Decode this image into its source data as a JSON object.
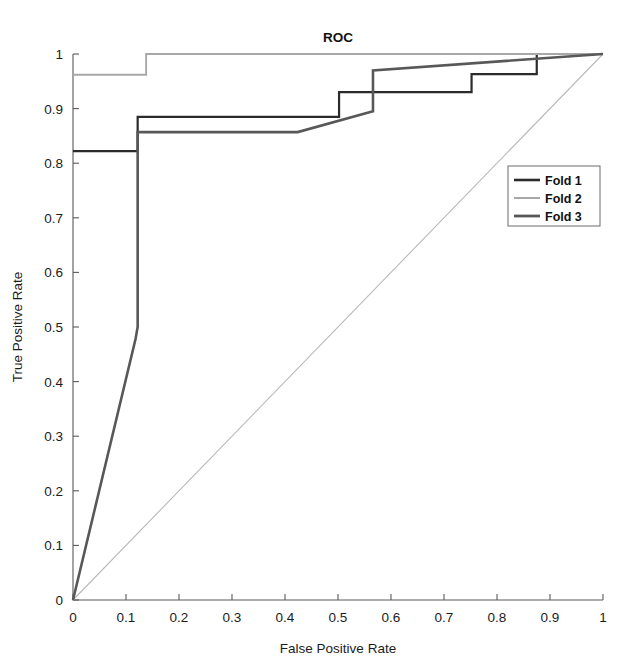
{
  "chart_data": {
    "type": "line",
    "title": "ROC",
    "xlabel": "False Positive Rate",
    "ylabel": "True Positive Rate",
    "xlim": [
      0,
      1
    ],
    "ylim": [
      0,
      1
    ],
    "grid": false,
    "legend_position": "center-right",
    "xticks": [
      "0",
      "0.1",
      "0.2",
      "0.3",
      "0.4",
      "0.5",
      "0.6",
      "0.7",
      "0.8",
      "0.9",
      "1"
    ],
    "xtick_values": [
      0,
      0.1,
      0.2,
      0.3,
      0.4,
      0.5,
      0.6,
      0.7,
      0.8,
      0.9,
      1
    ],
    "yticks": [
      "0",
      "0.1",
      "0.2",
      "0.3",
      "0.4",
      "0.5",
      "0.6",
      "0.7",
      "0.8",
      "0.9",
      "1"
    ],
    "ytick_values": [
      0,
      0.1,
      0.2,
      0.3,
      0.4,
      0.5,
      0.6,
      0.7,
      0.8,
      0.9,
      1
    ],
    "reference_line": {
      "name": "chance-diagonal",
      "x": [
        0,
        1
      ],
      "y": [
        0,
        1
      ],
      "color": "#b9b9b9"
    },
    "series": [
      {
        "name": "Fold 1",
        "color": "#2b2b2b",
        "width": 2.2,
        "x": [
          0,
          0.122,
          0.122,
          0.502,
          0.502,
          0.752,
          0.752,
          0.875,
          0.875,
          1
        ],
        "y": [
          0.822,
          0.822,
          0.885,
          0.885,
          0.93,
          0.93,
          0.963,
          0.963,
          1,
          1
        ]
      },
      {
        "name": "Fold 2",
        "color": "#a8a8a8",
        "width": 1.9,
        "x": [
          0,
          0.138,
          0.138,
          1
        ],
        "y": [
          0.962,
          0.962,
          1,
          1
        ]
      },
      {
        "name": "Fold 3",
        "color": "#585858",
        "width": 2.6,
        "x": [
          0,
          0.118,
          0.122,
          0.122,
          0.424,
          0.566,
          0.566,
          1
        ],
        "y": [
          0,
          0.478,
          0.5,
          0.857,
          0.857,
          0.895,
          0.97,
          1
        ]
      }
    ]
  },
  "legend": {
    "items": [
      {
        "label": "Fold 1",
        "color": "#2b2b2b",
        "width": 2.6
      },
      {
        "label": "Fold 2",
        "color": "#a8a8a8",
        "width": 2.0
      },
      {
        "label": "Fold 3",
        "color": "#585858",
        "width": 2.8
      }
    ]
  }
}
